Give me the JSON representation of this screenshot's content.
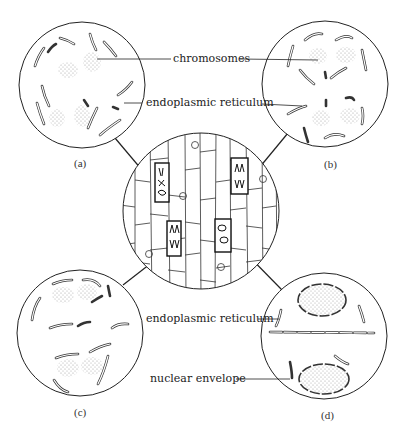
{
  "figure": {
    "callouts": {
      "chromosomes": "chromosomes",
      "er_top": "endoplasmic reticulum",
      "er_bottom": "endoplasmic reticulum",
      "nuclear_envelope": "nuclear envelope"
    },
    "panels": [
      {
        "id": "a",
        "label": "(a)"
      },
      {
        "id": "b",
        "label": "(b)"
      },
      {
        "id": "c",
        "label": "(c)"
      },
      {
        "id": "d",
        "label": "(d)"
      }
    ],
    "colors": {
      "line": "#222222",
      "stipple": "#888888",
      "background": "#ffffff"
    }
  }
}
